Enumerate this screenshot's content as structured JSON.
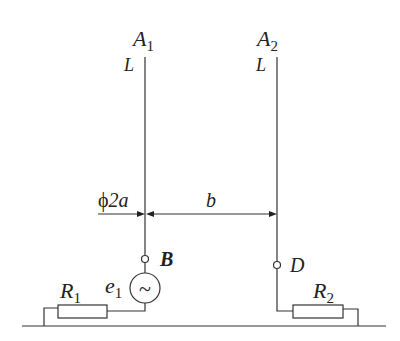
{
  "diagram": {
    "type": "two-wire antenna circuit",
    "conductors": [
      {
        "id": "A1",
        "label": "A",
        "subscript": "1",
        "length_label": "L"
      },
      {
        "id": "A2",
        "label": "A",
        "subscript": "2",
        "length_label": "L"
      }
    ],
    "dimensions": {
      "diameter_label": "2a",
      "diameter_symbol": "ϕ",
      "separation_label": "b"
    },
    "terminals": [
      {
        "id": "B",
        "label": "B"
      },
      {
        "id": "D",
        "label": "D"
      }
    ],
    "source": {
      "label": "e",
      "subscript": "1",
      "symbol": "~"
    },
    "resistors": [
      {
        "id": "R1",
        "label": "R",
        "subscript": "1"
      },
      {
        "id": "R2",
        "label": "R",
        "subscript": "2"
      }
    ],
    "colors": {
      "line": "#333333",
      "text": "#222222",
      "background": "#ffffff"
    }
  }
}
